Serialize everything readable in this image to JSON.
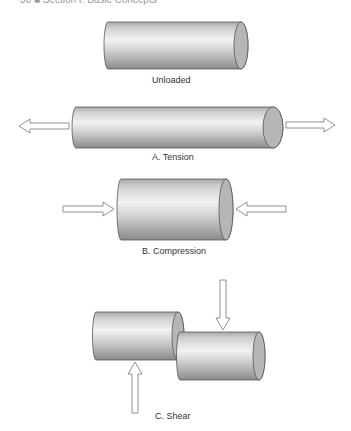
{
  "page_header": "36  ■  Section I: Basic Concepts",
  "figure": {
    "colors": {
      "cylinder_light": "#ececec",
      "cylinder_mid": "#c4c4c4",
      "cylinder_dark": "#8c8c8c",
      "cap_fill": "#b4b4b4",
      "outline": "#555555",
      "arrow_fill": "#ffffff",
      "arrow_stroke": "#777777"
    },
    "panels": [
      {
        "id": "unloaded",
        "label": "Unloaded"
      },
      {
        "id": "tension",
        "label": "A.  Tension"
      },
      {
        "id": "compression",
        "label": "B.  Compression"
      },
      {
        "id": "shear",
        "label": "C.  Shear"
      }
    ]
  }
}
